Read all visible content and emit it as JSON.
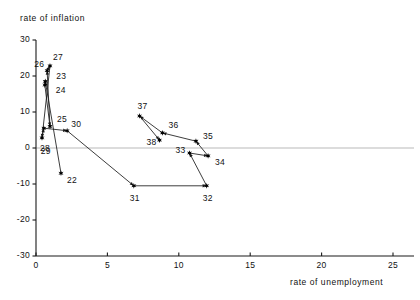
{
  "chart_data": {
    "type": "scatter",
    "title": "",
    "xlabel": "rate of unemployment",
    "ylabel": "rate of inflation",
    "xlim": [
      0,
      26
    ],
    "ylim": [
      -30,
      30
    ],
    "xticks": [
      "0",
      "5",
      "10",
      "15",
      "20",
      "25"
    ],
    "xtick_values": [
      0,
      5,
      10,
      15,
      20,
      25
    ],
    "yticks": [
      "30",
      "20",
      "10",
      "0",
      "-10",
      "-20",
      "-30"
    ],
    "ytick_values": [
      30,
      20,
      10,
      0,
      -10,
      -20,
      -30
    ],
    "grid": false,
    "zero_line": true,
    "legend": "none",
    "connected": true,
    "marker": "star",
    "series": [
      {
        "name": "UK inflation vs unemployment",
        "points": [
          {
            "label": "22",
            "x": 1.75,
            "y": -7.0
          },
          {
            "label": "23",
            "x": 0.65,
            "y": 18.5
          },
          {
            "label": "24",
            "x": 0.62,
            "y": 17.5
          },
          {
            "label": "25",
            "x": 0.98,
            "y": 6.0
          },
          {
            "label": "26",
            "x": 0.78,
            "y": 21.5
          },
          {
            "label": "27",
            "x": 0.98,
            "y": 22.8
          },
          {
            "label": "28",
            "x": 0.42,
            "y": 2.8
          },
          {
            "label": "29",
            "x": 0.55,
            "y": 5.5
          },
          {
            "label": "30",
            "x": 2.18,
            "y": 4.8
          },
          {
            "label": "31",
            "x": 6.85,
            "y": -10.5
          },
          {
            "label": "32",
            "x": 11.95,
            "y": -10.5
          },
          {
            "label": "33",
            "x": 10.75,
            "y": -1.4
          },
          {
            "label": "34",
            "x": 12.05,
            "y": -2.2
          },
          {
            "label": "35",
            "x": 11.2,
            "y": 1.9
          },
          {
            "label": "36",
            "x": 8.85,
            "y": 4.2
          },
          {
            "label": "37",
            "x": 7.25,
            "y": 8.9
          },
          {
            "label": "38",
            "x": 8.65,
            "y": 2.2
          }
        ],
        "path_order": [
          "22",
          "23",
          "24",
          "25",
          "26",
          "27",
          "28",
          "29",
          "30",
          "31",
          "32",
          "33",
          "34",
          "35",
          "36",
          "37",
          "38"
        ]
      }
    ],
    "label_offsets": {
      "22": {
        "dx": 6,
        "dy": 8
      },
      "23": {
        "dx": 11,
        "dy": -4
      },
      "24": {
        "dx": 11,
        "dy": 6
      },
      "25": {
        "dx": 7,
        "dy": -6
      },
      "26": {
        "dx": -13,
        "dy": -6
      },
      "27": {
        "dx": 3,
        "dy": -8
      },
      "28": {
        "dx": -2,
        "dy": 11
      },
      "29": {
        "dx": -3,
        "dy": 24
      },
      "30": {
        "dx": 4,
        "dy": -6
      },
      "31": {
        "dx": -4,
        "dy": 13
      },
      "32": {
        "dx": -4,
        "dy": 13
      },
      "33": {
        "dx": -14,
        "dy": -2
      },
      "34": {
        "dx": 7,
        "dy": 7
      },
      "35": {
        "dx": 7,
        "dy": -4
      },
      "36": {
        "dx": 6,
        "dy": -7
      },
      "37": {
        "dx": -2,
        "dy": -9
      },
      "38": {
        "dx": -13,
        "dy": 3
      }
    }
  },
  "geometry": {
    "x0_px": 36,
    "x_unit_px": 14.28,
    "y0_px": 148,
    "y_unit_px": 3.6,
    "axis_left_px": 36,
    "axis_bottom_px": 256,
    "axis_top_px": 40,
    "axis_right_px": 414
  },
  "colors": {
    "axis": "#1a1a1a",
    "line": "#1a1a1a",
    "marker": "#000000",
    "zero_line": "#b9b9b9",
    "text": "#111111",
    "background": "#ffffff"
  }
}
